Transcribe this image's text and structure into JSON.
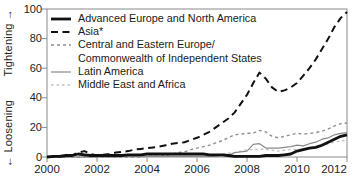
{
  "figure": {
    "background": "#ffffff",
    "frame_color": "#8a8a8a",
    "text_color": "#222222"
  },
  "axes": {
    "y_label_bottom": "← Loosening",
    "y_label_top": "Tightening →",
    "y_ticks": [
      0,
      20,
      40,
      60,
      80,
      100
    ],
    "x_ticks": [
      2000,
      2002,
      2004,
      2006,
      2008,
      2010,
      2012
    ]
  },
  "chart_data": {
    "type": "line",
    "title": "",
    "xlabel": "",
    "ylabel": "← Loosening / Tightening →",
    "xlim": [
      2000,
      2012
    ],
    "ylim": [
      0,
      100
    ],
    "grid": false,
    "legend_position": "top-left",
    "x": [
      2000,
      2000.25,
      2000.5,
      2000.75,
      2001,
      2001.25,
      2001.5,
      2001.75,
      2002,
      2002.25,
      2002.5,
      2002.75,
      2003,
      2003.25,
      2003.5,
      2003.75,
      2004,
      2004.25,
      2004.5,
      2004.75,
      2005,
      2005.25,
      2005.5,
      2005.75,
      2006,
      2006.25,
      2006.5,
      2006.75,
      2007,
      2007.25,
      2007.5,
      2007.75,
      2008,
      2008.25,
      2008.5,
      2008.75,
      2009,
      2009.25,
      2009.5,
      2009.75,
      2010,
      2010.25,
      2010.5,
      2010.75,
      2011,
      2011.25,
      2011.5,
      2011.75,
      2012
    ],
    "series": [
      {
        "name": "Advanced Europe and North America",
        "color": "#111111",
        "stroke_width": 2.8,
        "dash": "",
        "values": [
          0,
          0.5,
          0.5,
          1,
          1,
          2,
          1.5,
          1,
          1,
          1,
          1,
          1,
          1,
          1.5,
          1.5,
          1.5,
          2,
          2,
          2,
          2,
          2,
          2,
          2,
          2,
          2,
          2,
          1.5,
          1.5,
          1.5,
          1,
          0.5,
          0.5,
          0.5,
          0.5,
          0.5,
          1,
          1,
          1,
          1.5,
          2,
          4,
          5,
          6,
          6.5,
          8,
          10,
          12,
          14,
          15
        ]
      },
      {
        "name": "Asia*",
        "color": "#111111",
        "stroke_width": 2,
        "dash": "7 4.5",
        "values": [
          0,
          0,
          0.5,
          0.5,
          1,
          3,
          4,
          2,
          1,
          1.5,
          2,
          3,
          3.5,
          4,
          5,
          5.5,
          6,
          6.5,
          7,
          8,
          9,
          9.5,
          10,
          11.5,
          13,
          15,
          17,
          20,
          23,
          26,
          30,
          36,
          42,
          50,
          57,
          53,
          47,
          44,
          45,
          47,
          50,
          55,
          60,
          66,
          73,
          80,
          88,
          94,
          98
        ]
      },
      {
        "name": "Central and Eastern Europe/\nCommonwealth of Independent States",
        "color": "#909090",
        "stroke_width": 1.4,
        "dash": "3 3",
        "values": [
          0,
          0,
          0,
          0,
          0,
          0,
          0,
          0,
          0,
          0,
          0,
          0,
          0,
          0,
          0,
          0,
          0.5,
          0.5,
          0.5,
          1,
          2,
          3,
          3.5,
          5,
          6,
          7,
          8,
          9.5,
          11,
          13,
          15,
          15.5,
          16,
          16,
          18,
          17,
          14,
          13,
          14,
          15,
          16,
          15.5,
          16,
          16.5,
          17.5,
          19,
          21,
          22.5,
          23
        ]
      },
      {
        "name": "Latin America",
        "color": "#8a8a8a",
        "stroke_width": 1.2,
        "dash": "",
        "values": [
          0,
          0,
          0,
          0,
          0,
          0,
          0,
          0,
          0,
          0,
          0,
          0,
          0.5,
          0.5,
          0.5,
          0.5,
          0.5,
          0.5,
          0.5,
          0.5,
          0.5,
          0.5,
          0.5,
          0.5,
          0.5,
          0.5,
          0.5,
          0.5,
          1,
          1,
          3,
          3.5,
          4,
          8.5,
          9,
          6,
          6,
          6,
          6.5,
          7,
          8,
          7.5,
          9,
          10,
          12,
          13,
          15,
          16,
          16.5
        ]
      },
      {
        "name": "Middle East and Africa",
        "color": "#c2c2c2",
        "stroke_width": 1.4,
        "dash": "2.5 3",
        "values": [
          0,
          0,
          0,
          0,
          0,
          0,
          0,
          0,
          0,
          0,
          0,
          0,
          0,
          0,
          0,
          0,
          0,
          0,
          0,
          0,
          0,
          0,
          0,
          0,
          0,
          0,
          0.5,
          1,
          2,
          2.5,
          3,
          4,
          5,
          5,
          5.5,
          5,
          4.5,
          4,
          4.5,
          5,
          5,
          5.5,
          6,
          7,
          8,
          9,
          10,
          11,
          11
        ]
      }
    ]
  }
}
